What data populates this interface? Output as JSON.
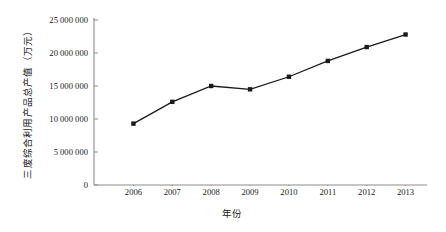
{
  "chart_data": {
    "type": "line",
    "title": "",
    "xlabel": "年份",
    "ylabel": "三废综合利用产品总产值（万元）",
    "categories": [
      "2006",
      "2007",
      "2008",
      "2009",
      "2010",
      "2011",
      "2012",
      "2013"
    ],
    "values": [
      9300000,
      12600000,
      15000000,
      14500000,
      16400000,
      18800000,
      20900000,
      22800000
    ],
    "series": [
      {
        "name": "三废综合利用产品总产值",
        "values": [
          9300000,
          12600000,
          15000000,
          14500000,
          16400000,
          18800000,
          20900000,
          22800000
        ]
      }
    ],
    "ylim": [
      0,
      25000000
    ],
    "ytick_values": [
      0,
      5000000,
      10000000,
      15000000,
      20000000,
      25000000
    ],
    "ytick_labels": [
      "0",
      "5 000 000",
      "10 000 000",
      "15 000 000",
      "20 000 000",
      "25 000 000"
    ],
    "xtick_labels": [
      "2006",
      "2007",
      "2008",
      "2009",
      "2010",
      "2011",
      "2012",
      "2013"
    ],
    "grid": false,
    "legend": "none",
    "marker": "square",
    "line_color": "#1a1a1a",
    "marker_color": "#1a1a1a",
    "axis_color": "#8c8c8c",
    "background": "#ffffff"
  }
}
